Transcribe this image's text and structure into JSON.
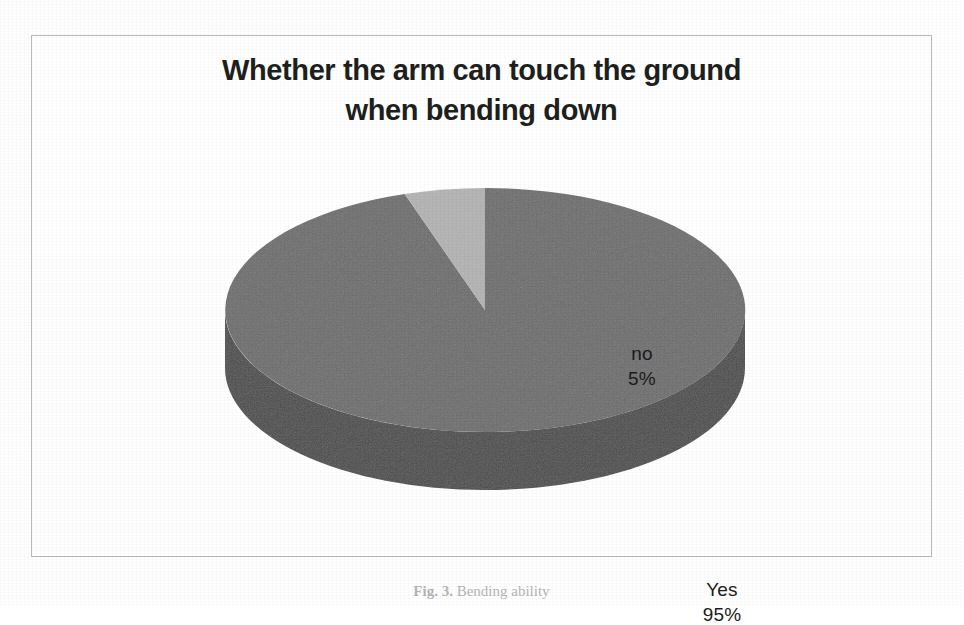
{
  "figure": {
    "title": "Whether the arm can touch the ground\nwhen bending down",
    "caption_label": "Fig. 3.",
    "caption_rest": " Bending ability",
    "frame_color": "#b9b9b9",
    "background": "#ffffff"
  },
  "chart_data": {
    "type": "pie",
    "title": "Whether the arm can touch the ground when bending down",
    "xlabel": "",
    "ylabel": "",
    "three_d": true,
    "start_angle_deg": 0,
    "direction": "clockwise",
    "legend": "none",
    "grid": false,
    "labels_inside": true,
    "categories": [
      "Yes",
      "no"
    ],
    "values": [
      95,
      5
    ],
    "unit": "%",
    "slices": [
      {
        "name": "Yes",
        "label": "Yes",
        "value": 95,
        "value_text": "95%",
        "label_text": "Yes\n95%",
        "top_color": "#6e6e6e",
        "side_color": "#4c4c4c",
        "start_deg": 0,
        "end_deg": 342
      },
      {
        "name": "no",
        "label": "no",
        "value": 5,
        "value_text": "5%",
        "label_text": "no\n5%",
        "top_color": "#b4b4b4",
        "side_color": "#8f8f8f",
        "start_deg": 342,
        "end_deg": 360
      }
    ]
  }
}
